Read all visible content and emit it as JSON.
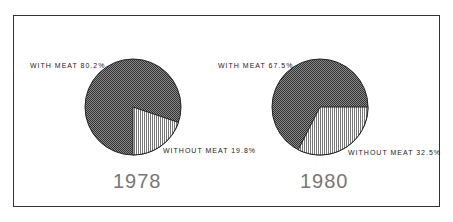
{
  "chart_data": [
    {
      "type": "pie",
      "title": "1978",
      "categories": [
        "WITH MEAT",
        "WITHOUT MEAT"
      ],
      "values": [
        80.2,
        19.8
      ],
      "labels": [
        "WITH MEAT 80.2%",
        "WITHOUT MEAT 19.8%"
      ]
    },
    {
      "type": "pie",
      "title": "1980",
      "categories": [
        "WITH MEAT",
        "WITHOUT MEAT"
      ],
      "values": [
        67.5,
        32.5
      ],
      "labels": [
        "WITH MEAT 67.5%",
        "WITHOUT MEAT 32.5%"
      ]
    }
  ],
  "colors": {
    "with_meat": "#555555",
    "without_meat": "#dddddd",
    "frame": "#333333"
  }
}
